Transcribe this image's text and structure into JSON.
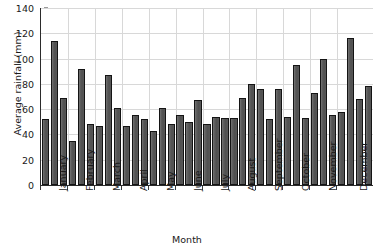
{
  "chart_data": {
    "type": "bar",
    "title": "",
    "xlabel": "Month",
    "ylabel": "Average rainfall (mm)",
    "ylim": [
      0,
      140
    ],
    "ytick_values": [
      0,
      20,
      40,
      60,
      80,
      100,
      120,
      140
    ],
    "grid": true,
    "legend": "none",
    "categories": [
      "January",
      "February",
      "March",
      "April",
      "May",
      "June",
      "July",
      "August",
      "September",
      "October",
      "November",
      "December"
    ],
    "bars_per_category": 3,
    "series": [
      {
        "name": "bar-1",
        "values": [
          52,
          35,
          47,
          47,
          43,
          55,
          48,
          53,
          76,
          54,
          73,
          58
        ]
      },
      {
        "name": "bar-2",
        "values": [
          114,
          92,
          87,
          55,
          61,
          50,
          54,
          69,
          52,
          95,
          100,
          116
        ]
      },
      {
        "name": "bar-3",
        "values": [
          69,
          48,
          61,
          52,
          48,
          67,
          53,
          80,
          76,
          53,
          55,
          68
        ]
      }
    ],
    "extra_bars": [
      {
        "category": "December",
        "value": 78
      }
    ],
    "bar_color": "#595959",
    "bar_edge_color": "#141414",
    "grid_color": "#d8d8d8",
    "axis_color": "#2b2b2b"
  }
}
